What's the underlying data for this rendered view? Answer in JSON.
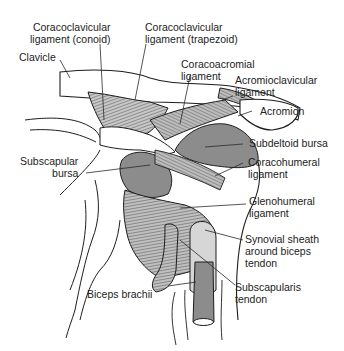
{
  "diagram": {
    "colors": {
      "bursa_fill": "#8c8c8c",
      "ligament_fill": "#c4c4c4",
      "bone_fill": "#ffffff",
      "outline": "#1e1e1e",
      "leader_line": "#2a2a2a"
    },
    "labels": {
      "coracoclavicular_conoid": [
        "Coracoclavicular",
        "ligament (conoid)"
      ],
      "coracoclavicular_trapezoid": [
        "Coracoclavicular",
        "ligament (trapezoid)"
      ],
      "clavicle": [
        "Clavicle"
      ],
      "coracoacromial": [
        "Coracoacromial",
        "ligament"
      ],
      "acromioclavicular": [
        "Acromioclavicular",
        "ligament"
      ],
      "acromion": [
        "Acromion"
      ],
      "subdeltoid_bursa": [
        "Subdeltoid bursa"
      ],
      "subscapular_bursa": [
        "Subscapular",
        "bursa"
      ],
      "coracohumeral": [
        "Coracohumeral",
        "ligament"
      ],
      "glenohumeral": [
        "Glenohumeral",
        "ligament"
      ],
      "synovial_sheath": [
        "Synovial sheath",
        "around biceps",
        "tendon"
      ],
      "biceps_brachii": [
        "Biceps brachii"
      ],
      "subscapularis_tendon": [
        "Subscapularis",
        "tendon"
      ]
    }
  }
}
